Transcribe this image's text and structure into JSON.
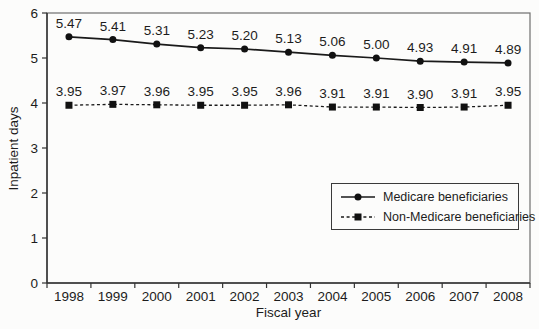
{
  "chart_data": {
    "type": "line",
    "title": "",
    "xlabel": "Fiscal year",
    "ylabel": "Inpatient days",
    "categories": [
      "1998",
      "1999",
      "2000",
      "2001",
      "2002",
      "2003",
      "2004",
      "2005",
      "2006",
      "2007",
      "2008"
    ],
    "series": [
      {
        "name": "Medicare beneficiaries",
        "marker": "circle",
        "line_style": "solid",
        "values": [
          5.47,
          5.41,
          5.31,
          5.23,
          5.2,
          5.13,
          5.06,
          5.0,
          4.93,
          4.91,
          4.89
        ]
      },
      {
        "name": "Non-Medicare beneficiaries",
        "marker": "square",
        "line_style": "dashed",
        "values": [
          3.95,
          3.97,
          3.96,
          3.95,
          3.95,
          3.96,
          3.91,
          3.91,
          3.9,
          3.91,
          3.95
        ]
      }
    ],
    "ylim": [
      0,
      6
    ],
    "y_ticks": [
      0,
      1,
      2,
      3,
      4,
      5,
      6
    ],
    "grid": false,
    "data_labels": true,
    "data_label_decimals": 2,
    "legend_position": "inside-lower-right",
    "colors": {
      "series": "#1a1a1a",
      "axis": "#333333",
      "plot_border": "#6e6e6e",
      "text": "#1c1c1c",
      "background": "#fcfcfb"
    }
  }
}
